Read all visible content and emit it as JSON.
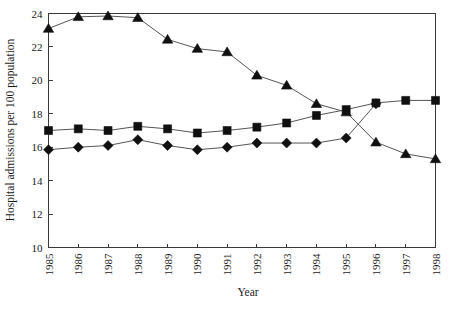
{
  "chart_data": {
    "type": "line",
    "title": "",
    "xlabel": "Year",
    "ylabel": "Hospital admissions per 100 population",
    "x": [
      1985,
      1986,
      1987,
      1988,
      1989,
      1990,
      1991,
      1992,
      1993,
      1994,
      1995,
      1996,
      1997,
      1998
    ],
    "categories": [
      "1985",
      "1986",
      "1987",
      "1988",
      "1989",
      "1990",
      "1991",
      "1992",
      "1993",
      "1994",
      "1995",
      "1996",
      "1997",
      "1998"
    ],
    "xlim": [
      1985,
      1998
    ],
    "ylim": [
      10,
      24
    ],
    "yticks": [
      10,
      12,
      14,
      16,
      18,
      20,
      22,
      24
    ],
    "ytick_labels": [
      "10",
      "12",
      "14",
      "16",
      "18",
      "20",
      "22",
      "24"
    ],
    "grid": false,
    "legend": "none",
    "series": [
      {
        "name": "triangle-series",
        "marker": "triangle",
        "color": "#101010",
        "x": [
          1985,
          1986,
          1987,
          1988,
          1989,
          1990,
          1991,
          1992,
          1993,
          1994,
          1995,
          1996,
          1997,
          1998
        ],
        "values": [
          23.1,
          23.8,
          23.85,
          23.75,
          22.45,
          21.9,
          21.7,
          20.3,
          19.7,
          18.6,
          18.1,
          16.3,
          15.6,
          15.3
        ]
      },
      {
        "name": "square-series",
        "marker": "square",
        "color": "#101010",
        "x": [
          1985,
          1986,
          1987,
          1988,
          1989,
          1990,
          1991,
          1992,
          1993,
          1994,
          1995,
          1996,
          1997,
          1998
        ],
        "values": [
          17.0,
          17.1,
          17.0,
          17.25,
          17.1,
          16.85,
          17.0,
          17.2,
          17.45,
          17.9,
          18.25,
          18.65,
          18.8,
          18.8
        ]
      },
      {
        "name": "diamond-series",
        "marker": "diamond",
        "color": "#101010",
        "x": [
          1985,
          1986,
          1987,
          1988,
          1989,
          1990,
          1991,
          1992,
          1993,
          1994,
          1995,
          1996
        ],
        "values": [
          15.85,
          16.0,
          16.1,
          16.45,
          16.1,
          15.85,
          16.0,
          16.25,
          16.25,
          16.25,
          16.55,
          18.6
        ]
      }
    ]
  }
}
